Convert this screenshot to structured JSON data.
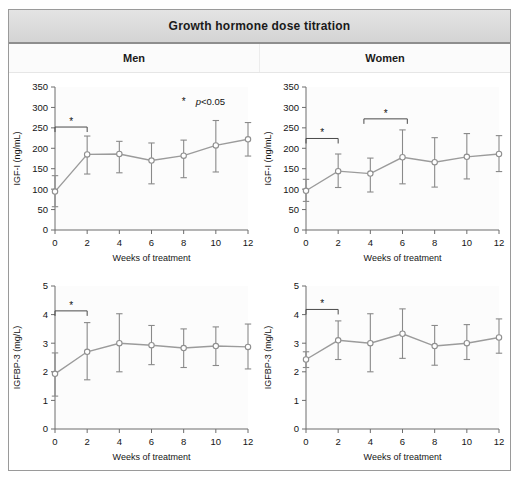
{
  "figure": {
    "title": "Growth hormone dose titration",
    "column_headers": [
      "Men",
      "Women"
    ],
    "legend": {
      "symbol": "*",
      "text": "p<0.05"
    }
  },
  "chart_data": [
    {
      "type": "line",
      "panel": "men-igf1",
      "title": "Men",
      "xlabel": "Weeks of treatment",
      "ylabel": "IGF-I (ng/mL)",
      "x": [
        0,
        2,
        4,
        6,
        8,
        10,
        12
      ],
      "values": [
        94,
        185,
        186,
        170,
        182,
        207,
        222
      ],
      "err_low": [
        57,
        137,
        140,
        113,
        128,
        142,
        181
      ],
      "err_high": [
        133,
        230,
        217,
        213,
        220,
        268,
        263
      ],
      "xlim": [
        0,
        12
      ],
      "ylim": [
        0,
        350
      ],
      "xticks": [
        0,
        2,
        4,
        6,
        8,
        10,
        12
      ],
      "yticks": [
        0,
        50,
        100,
        150,
        200,
        250,
        300,
        350
      ],
      "grid": false,
      "markers": "open-circle",
      "errorbars": true,
      "annotations": [
        {
          "type": "significance-bracket",
          "x_from": 0,
          "x_to": 2,
          "y": 252,
          "label": "*"
        },
        {
          "type": "legend",
          "x": 8.2,
          "y": 305,
          "label": "*  p<0.05"
        }
      ]
    },
    {
      "type": "line",
      "panel": "women-igf1",
      "title": "Women",
      "xlabel": "Weeks of treatment",
      "ylabel": "IGF-I (ng/mL)",
      "x": [
        0,
        2,
        4,
        6,
        8,
        10,
        12
      ],
      "values": [
        96,
        144,
        138,
        178,
        166,
        179,
        186
      ],
      "err_low": [
        70,
        104,
        93,
        113,
        105,
        125,
        143
      ],
      "err_high": [
        124,
        186,
        176,
        245,
        226,
        236,
        231
      ],
      "xlim": [
        0,
        12
      ],
      "ylim": [
        0,
        350
      ],
      "xticks": [
        0,
        2,
        4,
        6,
        8,
        10,
        12
      ],
      "yticks": [
        0,
        50,
        100,
        150,
        200,
        250,
        300,
        350
      ],
      "grid": false,
      "markers": "open-circle",
      "errorbars": true,
      "annotations": [
        {
          "type": "significance-bracket",
          "x_from": 0,
          "x_to": 2,
          "y": 224,
          "label": "*"
        },
        {
          "type": "significance-bracket",
          "x_from": 3.6,
          "x_to": 6.3,
          "y": 272,
          "label": "*"
        }
      ]
    },
    {
      "type": "line",
      "panel": "men-igfbp3",
      "title": "Men",
      "xlabel": "Weeks of treatment",
      "ylabel": "IGFBP-3 (mg/L)",
      "x": [
        0,
        2,
        4,
        6,
        8,
        10,
        12
      ],
      "values": [
        1.93,
        2.7,
        3.0,
        2.93,
        2.83,
        2.9,
        2.87
      ],
      "err_low": [
        1.15,
        1.72,
        2.0,
        2.25,
        2.15,
        2.22,
        2.1
      ],
      "err_high": [
        2.66,
        3.72,
        4.03,
        3.62,
        3.5,
        3.57,
        3.67
      ],
      "xlim": [
        0,
        12
      ],
      "ylim": [
        0,
        5
      ],
      "xticks": [
        0,
        2,
        4,
        6,
        8,
        10,
        12
      ],
      "yticks": [
        0,
        1,
        2,
        3,
        4,
        5
      ],
      "grid": false,
      "markers": "open-circle",
      "errorbars": true,
      "annotations": [
        {
          "type": "significance-bracket",
          "x_from": 0,
          "x_to": 2,
          "y": 4.13,
          "label": "*"
        }
      ]
    },
    {
      "type": "line",
      "panel": "women-igfbp3",
      "title": "Women",
      "xlabel": "Weeks of treatment",
      "ylabel": "IGFBP-3 (mg/L)",
      "x": [
        0,
        2,
        4,
        6,
        8,
        10,
        12
      ],
      "values": [
        2.43,
        3.1,
        3.0,
        3.33,
        2.9,
        3.0,
        3.2
      ],
      "err_low": [
        2.15,
        2.43,
        2.0,
        2.47,
        2.23,
        2.43,
        2.65
      ],
      "err_high": [
        2.7,
        3.78,
        4.03,
        4.2,
        3.62,
        3.65,
        3.85
      ],
      "xlim": [
        0,
        12
      ],
      "ylim": [
        0,
        5
      ],
      "xticks": [
        0,
        1,
        2,
        3,
        4,
        5
      ],
      "yticks": [
        0,
        1,
        2,
        3,
        4,
        5
      ],
      "grid": false,
      "markers": "open-circle",
      "errorbars": true,
      "annotations": [
        {
          "type": "significance-bracket",
          "x_from": 0,
          "x_to": 2,
          "y": 4.18,
          "label": "*"
        }
      ]
    }
  ]
}
